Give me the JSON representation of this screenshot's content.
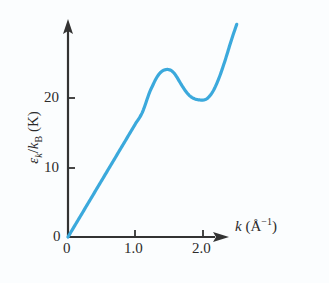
{
  "figure": {
    "background_color": "#fbfdfe",
    "axis_color": "#333333",
    "curve_color": "#3BA9DC",
    "text_color": "#2b2b2b"
  },
  "axes": {
    "x": {
      "title_symbol": "k",
      "title_unit_open": " (Å",
      "title_unit_sup": "−1",
      "title_unit_close": ")",
      "title_full": "k (Å⁻¹)",
      "ticks": [
        {
          "value": 0,
          "label": "0"
        },
        {
          "value": 1.0,
          "label": "1.0"
        },
        {
          "value": 2.0,
          "label": "2.0"
        }
      ],
      "range": [
        0,
        2.6
      ],
      "arrow": true
    },
    "y": {
      "title_sym1": "ε",
      "title_sub1": "k",
      "title_slash": "/",
      "title_sym2": "k",
      "title_sub2": "B",
      "title_unit": " (K)",
      "title_full": "εₖ/kᴮ (K)",
      "ticks": [
        {
          "value": 0,
          "label": "0"
        },
        {
          "value": 10,
          "label": "10"
        },
        {
          "value": 20,
          "label": "20"
        }
      ],
      "range": [
        0,
        31
      ],
      "arrow": true
    }
  },
  "chart_data": {
    "type": "line",
    "title": "",
    "subtitle": "",
    "xlabel": "k (Å⁻¹)",
    "ylabel": "εₖ/kᴮ (K)",
    "xlim": [
      0,
      2.6
    ],
    "ylim": [
      0,
      31
    ],
    "xticks": [
      0,
      1.0,
      2.0
    ],
    "xticklabels": [
      "0",
      "1.0",
      "2.0"
    ],
    "yticks": [
      0,
      10,
      20
    ],
    "yticklabels": [
      "0",
      "10",
      "20"
    ],
    "grid": false,
    "legend": null,
    "annotations": [],
    "series": [
      {
        "name": "phonon-roton dispersion",
        "color": "#3BA9DC",
        "linewidth": 3,
        "x": [
          0.0,
          0.1,
          0.2,
          0.3,
          0.4,
          0.5,
          0.6,
          0.7,
          0.8,
          0.9,
          1.0,
          1.1,
          1.2,
          1.25,
          1.3,
          1.35,
          1.4,
          1.45,
          1.48,
          1.52,
          1.56,
          1.6,
          1.65,
          1.7,
          1.75,
          1.8,
          1.85,
          1.9,
          1.95,
          2.0,
          2.05,
          2.1,
          2.15,
          2.2,
          2.25,
          2.3,
          2.35,
          2.4,
          2.45,
          2.5
        ],
        "y": [
          0.0,
          1.63,
          3.26,
          4.89,
          6.52,
          8.15,
          9.78,
          11.41,
          13.04,
          14.67,
          16.3,
          17.9,
          20.6,
          21.7,
          22.7,
          23.45,
          23.9,
          24.08,
          24.1,
          24.0,
          23.7,
          23.2,
          22.4,
          21.6,
          20.9,
          20.35,
          20.0,
          19.8,
          19.72,
          19.7,
          19.85,
          20.3,
          21.0,
          22.0,
          23.2,
          24.6,
          26.1,
          27.7,
          29.2,
          30.6
        ]
      }
    ],
    "key_points": {
      "origin": {
        "k": 0.0,
        "energy": 0.0,
        "label": "origin"
      },
      "maxon_peak": {
        "k": 1.48,
        "energy": 24.1,
        "label": "maxon maximum"
      },
      "roton_minimum": {
        "k": 2.0,
        "energy": 19.7,
        "label": "roton minimum"
      },
      "curve_end": {
        "k": 2.5,
        "energy": 30.6,
        "label": "curve end"
      }
    }
  }
}
